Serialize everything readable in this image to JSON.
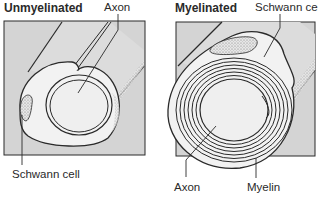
{
  "panels": [
    {
      "id": "unmyelinated",
      "title": "Unmyelinated",
      "labels": {
        "axon": "Axon",
        "schwann": "Schwann cell"
      }
    },
    {
      "id": "myelinated",
      "title": "Myelinated",
      "labels": {
        "schwann": "Schwann cell",
        "axon": "Axon",
        "myelin": "Myelin"
      }
    }
  ],
  "colors": {
    "background_box": "#d4d4d4",
    "cell_fill": "#f2f2f2",
    "stroke": "#2a2a2a",
    "stipple": "#8a8a8a"
  }
}
